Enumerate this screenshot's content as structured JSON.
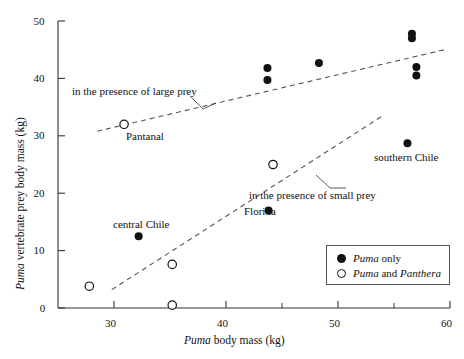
{
  "figure": {
    "title": "",
    "background": "#ffffff",
    "foreground": "#111111"
  },
  "axes": {
    "x_title_parts": {
      "italic": "Puma",
      "rest": " body mass (kg)"
    },
    "y_title_parts": {
      "italic": "Puma",
      "rest": " vertebrate prey body mass (kg)"
    },
    "x_tick_labels": [
      "30",
      "40",
      "50",
      "60"
    ],
    "y_tick_labels": [
      "0",
      "10",
      "20",
      "30",
      "40",
      "50"
    ]
  },
  "annotations": {
    "large_prey": "in the presence of large prey",
    "small_prey": "in the presence of small prey",
    "pantanal": "Pantanal",
    "central_chile": "central Chile",
    "florida": "Florida",
    "southern_chile": "southern Chile"
  },
  "legend": {
    "items": [
      {
        "marker": "filled-circle",
        "italic": "Puma",
        "rest": " only"
      },
      {
        "marker": "open-circle",
        "italic1": "Puma",
        "mid": " and ",
        "italic2": "Panthera"
      }
    ]
  },
  "chart_data": {
    "type": "scatter",
    "title": "",
    "xlabel": "Puma body mass (kg)",
    "ylabel": "Puma vertebrate prey body mass (kg)",
    "xlim": [
      25,
      60
    ],
    "ylim": [
      0,
      50
    ],
    "xticks": [
      30,
      40,
      50,
      60
    ],
    "xminor_ticks": [
      35,
      45,
      55
    ],
    "yticks": [
      0,
      10,
      20,
      30,
      40,
      50
    ],
    "grid": false,
    "legend_position": "lower-right",
    "series": [
      {
        "name": "Puma only",
        "marker": "filled-circle",
        "points": [
          {
            "x": 32.2,
            "y": 12.5,
            "label": "central Chile"
          },
          {
            "x": 43.7,
            "y": 41.8,
            "label": ""
          },
          {
            "x": 43.7,
            "y": 39.7,
            "label": ""
          },
          {
            "x": 43.8,
            "y": 17.0,
            "label": "Florida"
          },
          {
            "x": 48.3,
            "y": 42.7,
            "label": ""
          },
          {
            "x": 56.6,
            "y": 47.8,
            "label": ""
          },
          {
            "x": 56.6,
            "y": 47.0,
            "label": ""
          },
          {
            "x": 56.2,
            "y": 28.7,
            "label": "southern Chile"
          },
          {
            "x": 57.0,
            "y": 42.0,
            "label": ""
          },
          {
            "x": 57.0,
            "y": 40.5,
            "label": ""
          }
        ]
      },
      {
        "name": "Puma and Panthera",
        "marker": "open-circle",
        "points": [
          {
            "x": 27.8,
            "y": 3.8,
            "label": ""
          },
          {
            "x": 30.9,
            "y": 32.0,
            "label": "Pantanal"
          },
          {
            "x": 35.2,
            "y": 7.6,
            "label": ""
          },
          {
            "x": 35.2,
            "y": 0.5,
            "label": ""
          },
          {
            "x": 44.2,
            "y": 25.0,
            "label": ""
          }
        ]
      }
    ],
    "trend_lines": [
      {
        "name": "in the presence of large prey",
        "style": "dashed",
        "x1": 28.5,
        "y1": 30.8,
        "x2": 59.5,
        "y2": 45.0
      },
      {
        "name": "in the presence of small prey",
        "style": "dashed",
        "x1": 29.8,
        "y1": 3.2,
        "x2": 54.0,
        "y2": 33.5
      }
    ]
  }
}
